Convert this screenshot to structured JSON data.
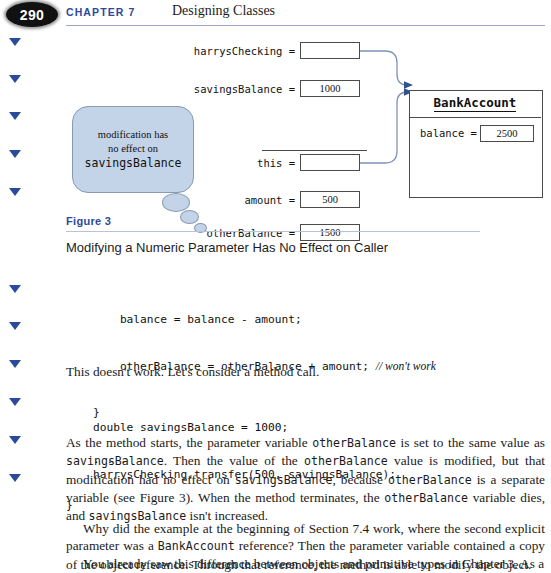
{
  "header": {
    "page_number": "290",
    "chapter_label": "CHAPTER 7",
    "chapter_title": "Designing Classes"
  },
  "margin_markers": {
    "icon": "triangle-down-icon",
    "color": "#2b4a9b",
    "count": 11,
    "positions_y": [
      38,
      75,
      112,
      150,
      188,
      285,
      322,
      360,
      398,
      436,
      474
    ]
  },
  "figure": {
    "callout": {
      "line1": "modification has",
      "line2": "no effect on",
      "line3": "savingsBalance"
    },
    "variables": [
      {
        "label": "harrysChecking =",
        "value": "",
        "kind": "reference"
      },
      {
        "label": "savingsBalance =",
        "value": "1000",
        "kind": "number"
      },
      {
        "label": "this =",
        "value": "",
        "kind": "reference"
      },
      {
        "label": "amount =",
        "value": "500",
        "kind": "number"
      },
      {
        "label": "otherBalance =",
        "value": "1500",
        "kind": "number"
      }
    ],
    "object": {
      "title": "BankAccount",
      "field_label": "balance =",
      "field_value": "2500"
    },
    "number": "Figure 3",
    "caption": "Modifying a Numeric Parameter Has No Effect on Caller"
  },
  "code_block_1": {
    "line1": "        balance = balance - amount;",
    "line2_code": "        otherBalance = otherBalance + amount; ",
    "line2_comment": "// won't work",
    "line3": "    }",
    "line4": "    . . .",
    "line5": "}"
  },
  "paragraph_1": "This doesn't work. Let's consider a method call.",
  "code_block_2": {
    "line1": "    double savingsBalance = 1000;",
    "line2": "    harrysChecking.transfer(500, savingsBalance);"
  },
  "paragraph_2": {
    "t1": "As the method starts, the parameter variable ",
    "c1": "otherBalance",
    "t2": " is set to the same value as ",
    "c2": "savingsBalance",
    "t3": ". Then the value of the ",
    "c3": "otherBalance",
    "t4": " value is modified, but that modification had no effect on ",
    "c4": "savingsBalance",
    "t5": ", because ",
    "c5": "otherBalance",
    "t6": " is a separate variable (see Figure 3). When the method terminates, the ",
    "c6": "otherBalance",
    "t7": " variable dies, and ",
    "c7": "savingsBalance",
    "t8": " isn't increased."
  },
  "paragraph_3": {
    "t1": "Why did the example at the beginning of Section 7.4 work, where the second explicit parameter was a ",
    "c1": "BankAccount",
    "t2": " reference? Then the parameter variable contained a copy of the object reference. Through that reference, the method is able to modify the object."
  },
  "paragraph_4": "You already saw this difference between objects and primitive types in Chapter 3. As a",
  "colors": {
    "accent_blue": "#2b4a9b",
    "callout_fill": "#c3d3e8",
    "callout_stroke": "#8a9ab2",
    "line_stroke": "#4b4b4b",
    "arrow_stroke": "#7d93b8"
  }
}
